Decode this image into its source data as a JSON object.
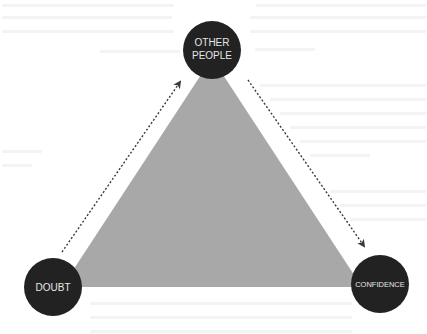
{
  "diagram": {
    "type": "triangle-relationship",
    "colors": {
      "background": "#ffffff",
      "triangle_fill": "#a8a8a8",
      "node_fill": "#222222",
      "node_text": "#e6e6e6",
      "arrow": "#3a3a3a"
    },
    "nodes": [
      {
        "id": "other-people",
        "lines": [
          "OTHER",
          "PEOPLE"
        ],
        "cx": 212,
        "cy": 50,
        "r": 28
      },
      {
        "id": "doubt",
        "lines": [
          "DOUBT"
        ],
        "cx": 53,
        "cy": 287,
        "r": 29
      },
      {
        "id": "confidence",
        "lines": [
          "CONFIDENCE"
        ],
        "cx": 380,
        "cy": 284,
        "r": 29
      }
    ],
    "edges": [
      {
        "from": "doubt",
        "to": "other-people",
        "style": "dotted-arrow"
      },
      {
        "from": "other-people",
        "to": "confidence",
        "style": "dotted-arrow"
      }
    ]
  }
}
